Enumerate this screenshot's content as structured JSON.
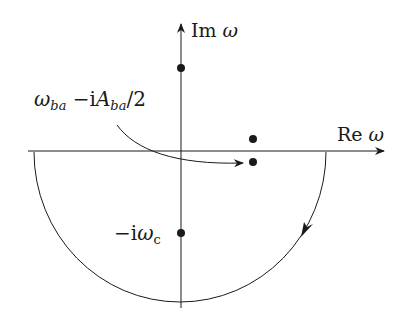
{
  "diagram": {
    "type": "complex-plane-contour",
    "colors": {
      "stroke": "#1a1a1a",
      "background": "#ffffff"
    },
    "axes": {
      "imaginary": {
        "label_prefix": "Im",
        "label_var": "ω"
      },
      "real": {
        "label_prefix": "Re",
        "label_var": "ω"
      }
    },
    "annotations": {
      "pole_label": {
        "omega": "ω",
        "omega_sub": "ba",
        "minus_i": " −i",
        "A": "A",
        "A_sub": "ba",
        "over2": "/2"
      },
      "lower_pole_label": {
        "minus_i": "−i",
        "omega": "ω",
        "sub": "c"
      }
    },
    "points": [
      {
        "name": "upper-imag-pole",
        "x": 181,
        "y": 68
      },
      {
        "name": "upper-right-pole",
        "x": 253,
        "y": 139
      },
      {
        "name": "lower-right-pole",
        "x": 253,
        "y": 162
      },
      {
        "name": "lower-imag-pole",
        "x": 181,
        "y": 233
      }
    ],
    "contour": {
      "shape": "lower-semicircle",
      "direction": "clockwise"
    }
  }
}
